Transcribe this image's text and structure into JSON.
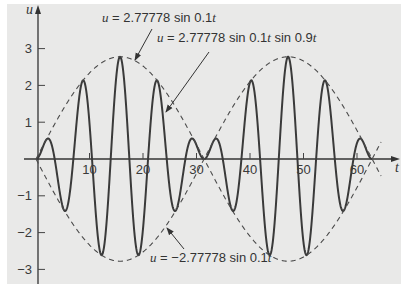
{
  "chart_data": {
    "type": "line",
    "title": "",
    "xlabel": "t",
    "ylabel": "u",
    "xlim": [
      0,
      66
    ],
    "ylim": [
      -3.3,
      3.6
    ],
    "grid": false,
    "legend": "none (inline annotations with arrows)",
    "x_ticks": [
      10,
      20,
      30,
      40,
      50,
      60
    ],
    "y_ticks": [
      -3,
      -2,
      -1,
      1,
      2,
      3
    ],
    "x_tick_labels": [
      "10",
      "20",
      "30",
      "40",
      "50",
      "60"
    ],
    "y_tick_labels": [
      "-3",
      "-2",
      "-1",
      "1",
      "2",
      "3"
    ],
    "series": [
      {
        "name": "u = 2.77778 sin 0.1t sin 0.9t",
        "style": "solid",
        "color": "#3a3a3a",
        "formula": {
          "amplitude": 2.77778,
          "envelope_freq": 0.1,
          "carrier_freq": 0.9
        },
        "t_range": [
          0,
          62.83
        ],
        "x": [
          0,
          2,
          4,
          6,
          8,
          10,
          12,
          14,
          16,
          18,
          20,
          22,
          24,
          26,
          28,
          30,
          32,
          34,
          36,
          38,
          40,
          42,
          44,
          46,
          48,
          50,
          52,
          54,
          56,
          58,
          60,
          62
        ],
        "values": [
          0,
          0.537,
          -0.479,
          -1.212,
          1.582,
          0.963,
          -2.54,
          0.092,
          2.687,
          -1.349,
          -1.897,
          1.805,
          0.762,
          -1.408,
          0.037,
          0.375,
          0.064,
          0.579,
          -0.972,
          -0.68,
          2.085,
          -0.224,
          -2.565,
          1.425,
          2.031,
          -2.266,
          -0.959,
          2.12,
          -0.047,
          -1.262,
          0.434,
          0.166
        ]
      },
      {
        "name": "u = 2.77778 sin 0.1t",
        "style": "dashed",
        "color": "#4a4a4a",
        "formula": {
          "amplitude": 2.77778,
          "freq": 0.1
        },
        "t_range": [
          0,
          64.5
        ]
      },
      {
        "name": "u = -2.77778 sin 0.1t",
        "style": "dashed",
        "color": "#4a4a4a",
        "formula": {
          "amplitude": -2.77778,
          "freq": 0.1
        },
        "t_range": [
          0,
          64.5
        ]
      }
    ],
    "annotations": [
      {
        "text_parts": [
          "u",
          " = 2.77778 sin 0.1",
          "t"
        ],
        "points_to": "upper envelope",
        "label_xy": [
          102,
          22
        ],
        "arrow": [
          [
            152,
            29
          ],
          [
            135,
            60
          ]
        ]
      },
      {
        "text_parts": [
          "u",
          " = 2.77778 sin 0.1",
          "t",
          " sin 0.9",
          "t"
        ],
        "points_to": "modulated wave",
        "label_xy": [
          157,
          42
        ],
        "arrow": [
          [
            209,
            52
          ],
          [
            166,
            112
          ]
        ]
      },
      {
        "text_parts": [
          "u",
          " = −2.77778 sin 0.1",
          "t"
        ],
        "points_to": "lower envelope",
        "label_xy": [
          150,
          262
        ],
        "arrow": [
          [
            184,
            249
          ],
          [
            167,
            228
          ]
        ]
      }
    ],
    "layout": {
      "origin_px": [
        36,
        159
      ],
      "px_per_t": 5.35,
      "px_per_u": 36.8,
      "x_axis_end_px": 400,
      "y_axis_top_px": 5,
      "y_axis_bottom_px": 284
    }
  }
}
